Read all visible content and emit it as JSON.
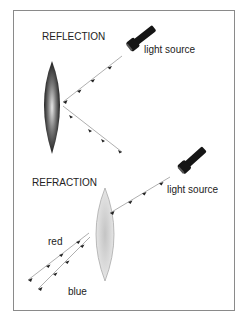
{
  "reflection": {
    "title": "REFLECTION",
    "source_label": "light source"
  },
  "refraction": {
    "title": "REFRACTION",
    "source_label": "light source",
    "ray_labels": {
      "red": "red",
      "blue": "blue"
    }
  },
  "colors": {
    "border": "#8a8a8a",
    "ray": "#9a9a9a",
    "arrow": "#222222",
    "flashlight": "#151515",
    "mirror_dark": "#111111",
    "lens_light": "#d8d8d8"
  },
  "icons": {
    "source_icon": "flashlight-icon",
    "mirror": "concave-mirror",
    "lens": "convex-lens"
  }
}
